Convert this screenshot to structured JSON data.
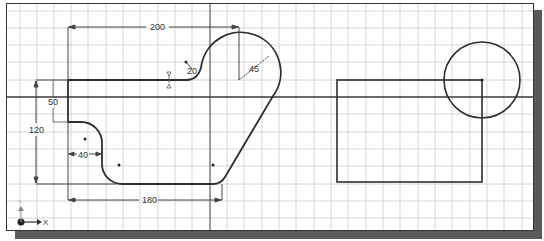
{
  "sketch": {
    "dimensions": {
      "width_top": "200",
      "fillet_small": "20",
      "arc_radius": "45",
      "left_height": "50",
      "total_height": "120",
      "step_width": "40",
      "bottom_width": "180"
    },
    "axis_labels": {
      "x": "X",
      "y": "Y"
    },
    "colors": {
      "grid": "#d4d4d4",
      "geometry": "#333333",
      "axis": "#444444",
      "dimension": "#555555",
      "shadow": "#5a5a5a"
    }
  }
}
